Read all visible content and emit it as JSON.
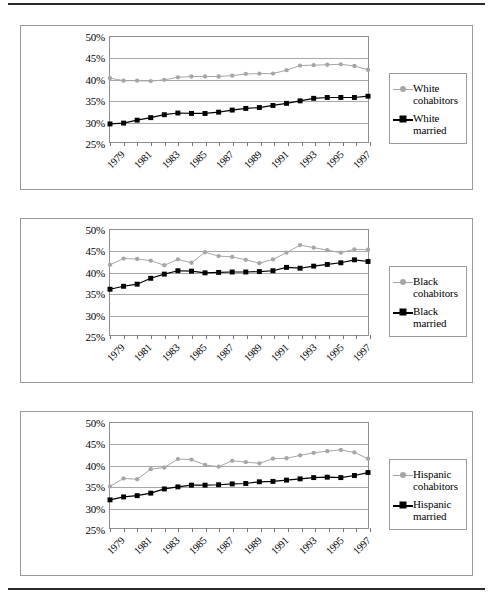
{
  "figure": {
    "panel_count": 3,
    "yaxis": {
      "ticks": [
        "50%",
        "45%",
        "40%",
        "35%",
        "30%",
        "25%"
      ],
      "min": 25,
      "max": 50
    },
    "xaxis": {
      "labels": [
        "1979",
        "1981",
        "1983",
        "1985",
        "1987",
        "1989",
        "1991",
        "1993",
        "1995",
        "1997"
      ],
      "min": 1979,
      "max": 1998
    },
    "colors": {
      "cohabitors": "#a6a6a6",
      "married": "#000000",
      "gridline": "#a8a8a8",
      "frame": "#8f8f8f",
      "panel_border": "#9a9a9a",
      "rule": "#2b2b2b"
    }
  },
  "chart_data": [
    {
      "type": "line",
      "title": "",
      "xlabel": "",
      "ylabel": "",
      "ylim": [
        25,
        50
      ],
      "xlim": [
        1979,
        1998
      ],
      "grid": true,
      "legend_position": "right",
      "x": [
        1979,
        1980,
        1981,
        1982,
        1983,
        1984,
        1985,
        1986,
        1987,
        1988,
        1989,
        1990,
        1991,
        1992,
        1993,
        1994,
        1995,
        1996,
        1997,
        1998
      ],
      "series": [
        {
          "name": "White cohabitors",
          "marker": "circle",
          "color": "#a6a6a6",
          "values": [
            40.2,
            39.6,
            39.6,
            39.5,
            39.8,
            40.4,
            40.6,
            40.6,
            40.6,
            40.8,
            41.2,
            41.3,
            41.3,
            42.1,
            43.2,
            43.3,
            43.4,
            43.5,
            43.1,
            42.2
          ]
        },
        {
          "name": "White married",
          "marker": "square",
          "color": "#000000",
          "values": [
            29.3,
            29.5,
            30.2,
            30.8,
            31.5,
            31.9,
            31.8,
            31.8,
            32.1,
            32.6,
            33.0,
            33.2,
            33.7,
            34.2,
            34.8,
            35.4,
            35.6,
            35.6,
            35.6,
            35.9
          ]
        }
      ]
    },
    {
      "type": "line",
      "title": "",
      "xlabel": "",
      "ylabel": "",
      "ylim": [
        25,
        50
      ],
      "xlim": [
        1979,
        1998
      ],
      "grid": true,
      "legend_position": "right",
      "x": [
        1979,
        1980,
        1981,
        1982,
        1983,
        1984,
        1985,
        1986,
        1987,
        1988,
        1989,
        1990,
        1991,
        1992,
        1993,
        1994,
        1995,
        1996,
        1997,
        1998
      ],
      "series": [
        {
          "name": "Black cohabitors",
          "marker": "circle",
          "color": "#a6a6a6",
          "values": [
            41.7,
            43.2,
            43.1,
            42.7,
            41.6,
            43.0,
            42.2,
            44.7,
            43.8,
            43.6,
            42.9,
            42.1,
            43.0,
            44.6,
            46.4,
            45.8,
            45.2,
            44.6,
            45.4,
            45.3
          ]
        },
        {
          "name": "Black married",
          "marker": "square",
          "color": "#000000",
          "values": [
            35.9,
            36.6,
            37.1,
            38.5,
            39.5,
            40.3,
            40.2,
            39.8,
            39.9,
            40.0,
            40.0,
            40.1,
            40.3,
            41.1,
            40.9,
            41.4,
            41.8,
            42.2,
            42.9,
            42.5
          ]
        }
      ]
    },
    {
      "type": "line",
      "title": "",
      "xlabel": "",
      "ylabel": "",
      "ylim": [
        25,
        50
      ],
      "xlim": [
        1979,
        1998
      ],
      "grid": true,
      "legend_position": "right",
      "x": [
        1979,
        1980,
        1981,
        1982,
        1983,
        1984,
        1985,
        1986,
        1987,
        1988,
        1989,
        1990,
        1991,
        1992,
        1993,
        1994,
        1995,
        1996,
        1997,
        1998
      ],
      "series": [
        {
          "name": "Hispanic cohabitors",
          "marker": "circle",
          "color": "#a6a6a6",
          "values": [
            34.9,
            36.8,
            36.6,
            39.0,
            39.4,
            41.4,
            41.3,
            40.0,
            39.6,
            41.0,
            40.7,
            40.4,
            41.5,
            41.6,
            42.3,
            42.9,
            43.3,
            43.6,
            43.0,
            41.5
          ]
        },
        {
          "name": "Hispanic married",
          "marker": "square",
          "color": "#000000",
          "values": [
            31.7,
            32.4,
            32.7,
            33.3,
            34.3,
            34.8,
            35.2,
            35.2,
            35.3,
            35.5,
            35.6,
            36.0,
            36.1,
            36.4,
            36.7,
            37.0,
            37.1,
            37.0,
            37.5,
            38.2
          ]
        }
      ]
    }
  ]
}
